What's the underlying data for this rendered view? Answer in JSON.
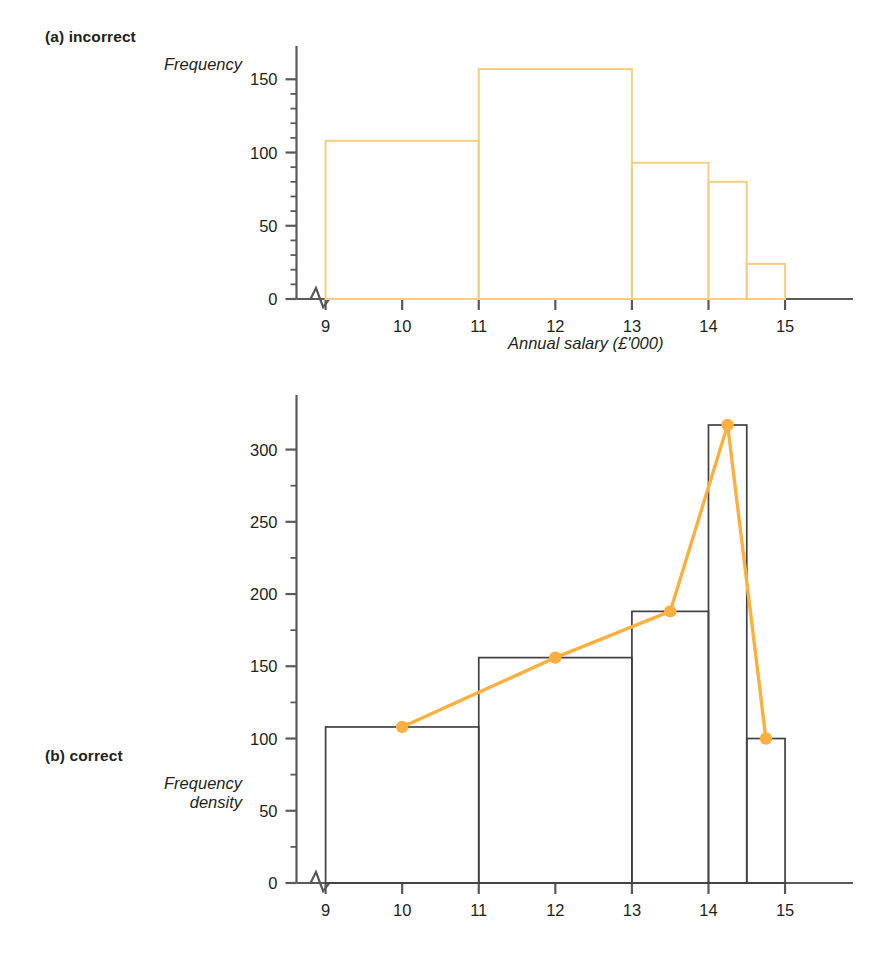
{
  "figure": {
    "panels": [
      {
        "id": "a",
        "title": "(a) incorrect",
        "ylabel": "Frequency",
        "xlabel": "Annual salary (£'000)",
        "bar_color": "#f5cf7f",
        "axis_color": "#58595b"
      },
      {
        "id": "b",
        "title": "(b) correct",
        "ylabel": "Frequency\ndensity",
        "ylabel_line1": "Frequency",
        "ylabel_line2": "density",
        "xlabel": "Annual salary (£'000)",
        "bar_color": "#414042",
        "polygon_color": "#fbb040",
        "axis_color": "#58595b"
      }
    ]
  },
  "chart_data": [
    {
      "type": "bar",
      "panel": "a",
      "title": "(a) incorrect",
      "xlabel": "Annual salary (£'000)",
      "ylabel": "Frequency",
      "xlim": [
        8.3,
        15.6
      ],
      "ylim": [
        0,
        170
      ],
      "yticks": [
        0,
        50,
        100,
        150
      ],
      "ytick_labels": [
        "0",
        "50",
        "100",
        "150"
      ],
      "yminor_step": 10,
      "xticks": [
        9,
        10,
        11,
        12,
        13,
        14,
        15
      ],
      "xtick_labels": [
        "9",
        "10",
        "11",
        "12",
        "13",
        "14",
        "15"
      ],
      "axis_break": true,
      "grid": false,
      "legend": "none",
      "bin_edges": [
        9,
        11,
        13,
        14,
        14.5,
        15
      ],
      "values": [
        108,
        157,
        93,
        80,
        24
      ],
      "bars": [
        {
          "from": 9,
          "to": 11,
          "height": 108
        },
        {
          "from": 11,
          "to": 13,
          "height": 157
        },
        {
          "from": 13,
          "to": 14,
          "height": 93
        },
        {
          "from": 14,
          "to": 14.5,
          "height": 80
        },
        {
          "from": 14.5,
          "to": 15,
          "height": 24
        }
      ]
    },
    {
      "type": "bar",
      "panel": "b",
      "title": "(b) correct",
      "xlabel": "Annual salary (£'000)",
      "ylabel": "Frequency density",
      "xlim": [
        8.3,
        15.6
      ],
      "ylim": [
        0,
        335
      ],
      "yticks": [
        0,
        50,
        100,
        150,
        200,
        250,
        300
      ],
      "ytick_labels": [
        "0",
        "50",
        "100",
        "150",
        "200",
        "250",
        "300"
      ],
      "yminor_step": 25,
      "xticks": [
        9,
        10,
        11,
        12,
        13,
        14,
        15
      ],
      "xtick_labels": [
        "9",
        "10",
        "11",
        "12",
        "13",
        "14",
        "15"
      ],
      "axis_break": true,
      "grid": false,
      "legend": "none",
      "bin_edges": [
        9,
        11,
        13,
        14,
        14.5,
        15
      ],
      "values": [
        108,
        156,
        188,
        317,
        100
      ],
      "bars": [
        {
          "from": 9,
          "to": 11,
          "height": 108
        },
        {
          "from": 11,
          "to": 13,
          "height": 156
        },
        {
          "from": 13,
          "to": 14,
          "height": 188
        },
        {
          "from": 14,
          "to": 14.5,
          "height": 317
        },
        {
          "from": 14.5,
          "to": 15,
          "height": 100
        }
      ],
      "series": [
        {
          "name": "frequency polygon",
          "x": [
            10,
            12,
            13.5,
            14.25,
            14.75
          ],
          "values": [
            108,
            156,
            188,
            317,
            100
          ],
          "marker": "circle"
        }
      ]
    }
  ]
}
